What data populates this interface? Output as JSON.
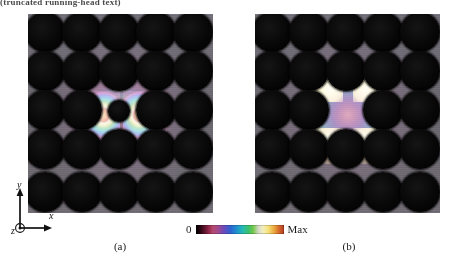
{
  "header": {
    "text": "(truncated running-head text)"
  },
  "figure": {
    "panels": [
      {
        "id": "a",
        "caption": "(a)",
        "description": "Photonic crystal with 5x5 array of dielectric rods; dipole-like localized defect mode at the center showing two bright lobes left and right of the central rod",
        "rod_grid": {
          "cols": 5,
          "rows": 5
        },
        "defect_type": "reduced-radius central rod",
        "mode_symmetry": "dipole"
      },
      {
        "id": "b",
        "caption": "(b)",
        "description": "Photonic crystal with 5x5 array of dielectric rods; monopole-like localized defect mode centered in the interstitial gap with four bright corner lobes and concentric rings",
        "rod_grid": {
          "cols": 5,
          "rows": 5
        },
        "defect_type": "missing rod",
        "mode_symmetry": "monopole"
      }
    ]
  },
  "colorbar": {
    "min_label": "0",
    "max_label": "Max",
    "orientation": "horizontal",
    "stops": [
      "#000000",
      "#4a0f22",
      "#8e2448",
      "#b4496c",
      "#a24a8e",
      "#6a4bbd",
      "#2f63cf",
      "#1f8fd0",
      "#26b9b2",
      "#3ec06a",
      "#74c84a",
      "#f2efbe",
      "#f6e27a",
      "#eba63c",
      "#d1622a",
      "#b33a20"
    ]
  },
  "axis_triad": {
    "x_label": "x",
    "y_label": "y",
    "z_label": "z",
    "z_direction": "out-of-page"
  },
  "colors": {
    "background": "#ffffff",
    "substrate": "#6e6a6e",
    "rod": "#000000",
    "text": "#1a1a1a"
  }
}
